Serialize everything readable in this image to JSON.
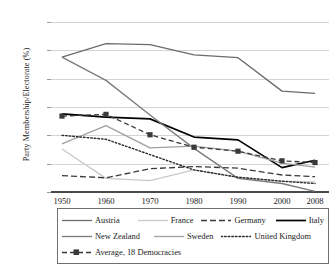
{
  "chart_data": {
    "type": "line",
    "title": "",
    "xlabel": "",
    "ylabel": "Party Membership/Electorate (%)",
    "x": [
      1950,
      1960,
      1970,
      1980,
      1990,
      2000,
      2008
    ],
    "xtick_labels": [
      "1950",
      "1960",
      "1970",
      "1980",
      "1990",
      "2000",
      "2008"
    ],
    "ytick_labels": [
      "0",
      "5",
      "10",
      "15",
      "20",
      "25",
      "30"
    ],
    "ylim": [
      0,
      30
    ],
    "ytick_step": 5,
    "grid": "horizontal",
    "legend_position": "below-axis",
    "series": [
      {
        "name": "Austria",
        "style": "solid",
        "color": "#6b6b6b",
        "width": 1.3,
        "marker": "none",
        "values": [
          23.8,
          26.2,
          26.0,
          24.2,
          23.7,
          17.8,
          17.4
        ]
      },
      {
        "name": "France",
        "style": "solid",
        "color": "#c9c9c9",
        "width": 1.3,
        "marker": "none",
        "values": [
          7.6,
          2.4,
          2.0,
          3.9,
          2.6,
          1.9,
          1.8
        ]
      },
      {
        "name": "Germany",
        "style": "dashed",
        "color": "#3a3a3a",
        "width": 1.3,
        "marker": "none",
        "values": [
          2.9,
          2.5,
          4.1,
          4.5,
          4.2,
          3.0,
          2.7
        ]
      },
      {
        "name": "Italy",
        "style": "solid",
        "color": "#000000",
        "width": 1.7,
        "marker": "none",
        "values": [
          13.8,
          13.2,
          12.9,
          9.7,
          9.2,
          4.3,
          5.6
        ]
      },
      {
        "name": "New Zealand",
        "style": "solid",
        "color": "#7a7a7a",
        "width": 1.3,
        "marker": "none",
        "values": [
          23.8,
          19.7,
          13.6,
          7.7,
          2.4,
          1.5,
          0.1
        ]
      },
      {
        "name": "Sweden",
        "style": "solid",
        "color": "#a0a0a0",
        "width": 1.3,
        "marker": "none",
        "values": [
          8.5,
          11.7,
          7.8,
          8.1,
          7.2,
          5.1,
          4.4
        ]
      },
      {
        "name": "United Kingdom",
        "style": "dotted",
        "color": "#2a2a2a",
        "width": 1.4,
        "marker": "none",
        "values": [
          10.0,
          9.3,
          6.6,
          3.9,
          2.6,
          1.9,
          1.5
        ]
      },
      {
        "name": "Average, 18 Democracies",
        "style": "dashed-marker",
        "color": "#3a3a3a",
        "width": 1.3,
        "marker": "square",
        "values": [
          13.4,
          13.7,
          10.1,
          7.9,
          7.2,
          5.5,
          5.2
        ]
      }
    ]
  },
  "legend": {
    "rows": [
      [
        "Austria",
        "France",
        "Germany",
        "Italy"
      ],
      [
        "New Zealand",
        "Sweden",
        "United Kingdom"
      ],
      [
        "Average, 18 Democracies"
      ]
    ]
  }
}
